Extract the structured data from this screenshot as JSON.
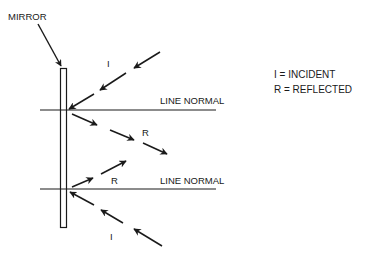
{
  "diagram": {
    "title_label": "MIRROR",
    "line_normal_top": "LINE NORMAL",
    "line_normal_bottom": "LINE NORMAL",
    "upper": {
      "incident_label": "I",
      "reflected_label": "R"
    },
    "lower": {
      "incident_label": "I",
      "reflected_label": "R"
    },
    "legend": {
      "incident": "I = INCIDENT",
      "reflected": "R = REFLECTED"
    },
    "colors": {
      "ink": "#1a1a1a",
      "background": "#ffffff"
    }
  }
}
